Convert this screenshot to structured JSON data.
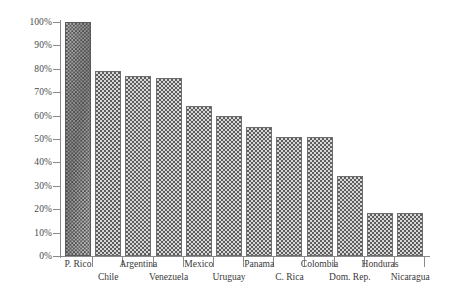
{
  "chart_data": {
    "type": "bar",
    "title": "",
    "subtitle": "",
    "xlabel": "",
    "ylabel": "",
    "ylim": [
      0,
      100
    ],
    "grid": false,
    "legend": null,
    "y_tick_labels": [
      "100%",
      "90%",
      "80%",
      "70%",
      "60%",
      "50%",
      "40%",
      "30%",
      "20%",
      "10%",
      "0%"
    ],
    "y_tick_values": [
      100,
      90,
      80,
      70,
      60,
      50,
      40,
      30,
      20,
      10,
      0
    ],
    "categories": [
      "P. Rico",
      "Chile",
      "Argentina",
      "Venezuela",
      "Mexico",
      "Uruguay",
      "Panama",
      "C. Rica",
      "Colombia",
      "Dom. Rep.",
      "Honduras",
      "Nicaragua"
    ],
    "values": [
      100,
      79,
      77,
      76,
      64,
      60,
      55,
      51,
      51,
      34,
      18.5,
      18.5
    ],
    "value_labels": [
      "100%",
      "79%",
      "77%",
      "76%",
      "64%",
      "60%",
      "55%",
      "51%",
      "51%",
      "34%",
      "18%",
      "18%"
    ],
    "highlight_index": 0,
    "colors": {
      "bar_fill": "#d7d7d7",
      "bar_hatch": "#5e5e5e",
      "bar_border": "#6e6e6e",
      "highlight_fill": "#bdbdbd",
      "highlight_hatch": "#4a4a4a",
      "axis": "#8a8a8a",
      "text": "#3a3a3a",
      "background": "#ffffff"
    }
  }
}
